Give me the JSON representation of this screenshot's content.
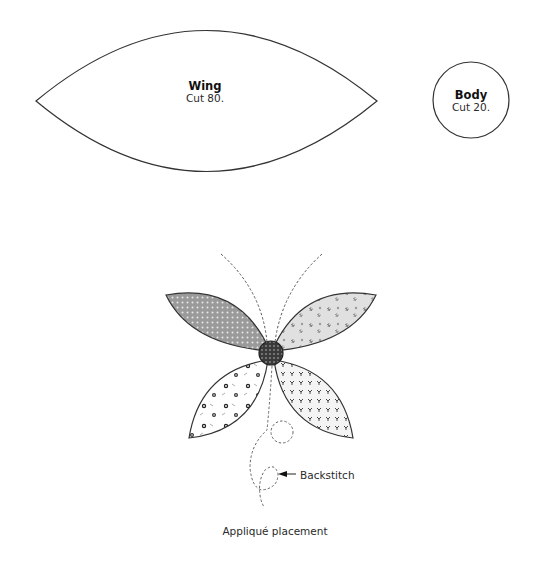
{
  "templates": {
    "wing": {
      "title": "Wing",
      "instruction": "Cut 80."
    },
    "body": {
      "title": "Body",
      "instruction": "Cut 20."
    }
  },
  "placement": {
    "callout": "Backstitch",
    "caption": "Appliqué placement",
    "fabrics": {
      "upper_left_wing": "gray with white dots",
      "upper_right_wing": "light gray floral",
      "lower_left_wing": "white with dark flowers",
      "lower_right_wing": "white with dark sprigs",
      "body": "dark with white dots"
    }
  },
  "colors": {
    "outline": "#333333",
    "dot_fabric": "#9a9a9a",
    "floral_fabric": "#dedede",
    "body_fabric": "#3a3a3a"
  }
}
